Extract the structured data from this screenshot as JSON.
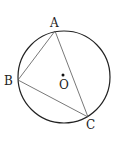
{
  "figure": {
    "circle": {
      "cx": 64,
      "cy": 77,
      "r": 46,
      "stroke": "#222222"
    },
    "center": {
      "label": "O",
      "x": 63,
      "y": 76
    },
    "points": {
      "A": {
        "label": "A",
        "x": 55,
        "y": 31
      },
      "B": {
        "label": "B",
        "x": 18,
        "y": 80
      },
      "C": {
        "label": "C",
        "x": 88,
        "y": 117
      }
    },
    "segments": [
      "AB",
      "AC",
      "BC"
    ]
  }
}
